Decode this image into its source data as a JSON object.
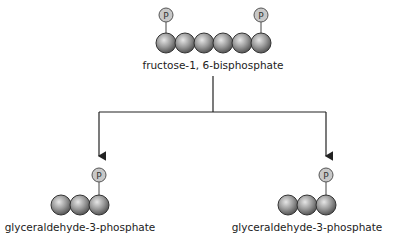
{
  "diagram": {
    "source": {
      "label": "fructose-1, 6-bisphosphate",
      "carbons": 6,
      "phosphate_symbol": "P",
      "phosphate_positions": [
        1,
        6
      ]
    },
    "products": [
      {
        "label": "glyceraldehyde-3-phosphate",
        "carbons": 3,
        "phosphate_symbol": "P",
        "phosphate_position": 3
      },
      {
        "label": "glyceraldehyde-3-phosphate",
        "carbons": 3,
        "phosphate_symbol": "P",
        "phosphate_position": 3
      }
    ],
    "colors": {
      "sphere": "#9a9a9a",
      "phosphate": "#c8c8c8",
      "line": "#222222"
    }
  }
}
